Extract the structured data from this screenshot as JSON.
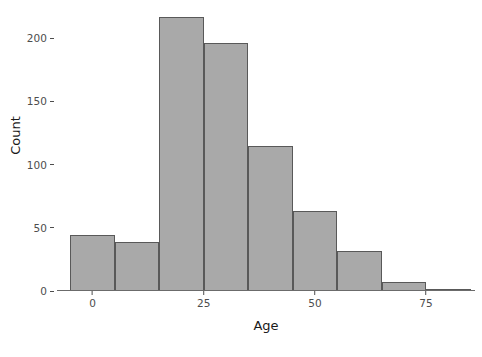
{
  "chart_data": {
    "type": "bar",
    "title": "",
    "xlabel": "Age",
    "ylabel": "Count",
    "categories": [
      "-5 to 5",
      "5 to 15",
      "15 to 25",
      "25 to 35",
      "35 to 45",
      "45 to 55",
      "55 to 65",
      "65 to 75",
      "75 to 85"
    ],
    "bin_edges": [
      -5,
      5,
      15,
      25,
      35,
      45,
      55,
      65,
      75,
      85
    ],
    "values": [
      44,
      39,
      217,
      196,
      115,
      63,
      32,
      7,
      1
    ],
    "bin_width": 10,
    "xlim": [
      -8,
      86
    ],
    "ylim": [
      0,
      224
    ],
    "xticks": [
      0,
      25,
      50,
      75
    ],
    "xtick_labels": [
      "0",
      "25",
      "50",
      "75"
    ],
    "yticks": [
      0,
      50,
      100,
      150,
      200
    ],
    "ytick_labels": [
      "0",
      "50",
      "100",
      "150",
      "200"
    ],
    "grid": false,
    "legend": "none",
    "bar_fill_color": "#a9a9a9",
    "bar_edge_color": "#595959",
    "axis_color": "#4d4d4d",
    "background_color": "#ffffff"
  },
  "figure": {
    "x_axis_title": "Age",
    "y_axis_title": "Count",
    "caption": ""
  }
}
